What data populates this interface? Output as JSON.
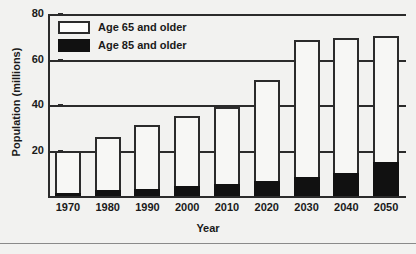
{
  "chart_data": {
    "type": "bar",
    "title": "",
    "subtitle": "",
    "xlabel": "Year",
    "ylabel": "Population (millions)",
    "categories": [
      "1970",
      "1980",
      "1990",
      "2000",
      "2010",
      "2020",
      "2030",
      "2040",
      "2050"
    ],
    "ylim": [
      0,
      80
    ],
    "yticks": [
      20,
      40,
      60,
      80
    ],
    "ytick_labels": [
      "20",
      "40",
      "60",
      "80"
    ],
    "grid": true,
    "grid_axis": "y",
    "stacked": true,
    "legend_position": "upper-left-inside",
    "series": [
      {
        "name": "Age 65 and older",
        "swatch": "hollow",
        "color": "#fdfdfc",
        "values": [
          20,
          26,
          31,
          35,
          39,
          51,
          68.5,
          69.5,
          70.5
        ]
      },
      {
        "name": "Age 85 and older",
        "swatch": "filled",
        "color": "#111111",
        "values": [
          1.5,
          2.5,
          3,
          4.5,
          5.5,
          6.5,
          8.5,
          10,
          15
        ]
      }
    ]
  },
  "legend": {
    "items": [
      {
        "label": "Age 65 and older",
        "swatch": "hollow"
      },
      {
        "label": "Age 85 and older",
        "swatch": "filled"
      }
    ]
  },
  "axes": {
    "y_title": "Population (millions)",
    "x_title": "Year"
  }
}
